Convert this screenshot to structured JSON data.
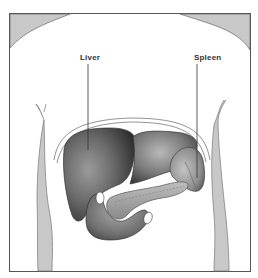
{
  "figure": {
    "labels": [
      {
        "text": "Liver",
        "x": 80,
        "y": 53
      },
      {
        "text": "Spleen",
        "x": 194,
        "y": 53
      }
    ]
  },
  "colors": {
    "frame": "#555555",
    "skin_shade": "#c8c8c8",
    "organ_dark": "#3a3a3a",
    "organ_mid": "#8a8a8a",
    "organ_light": "#d0d0d0",
    "background": "#ffffff"
  }
}
